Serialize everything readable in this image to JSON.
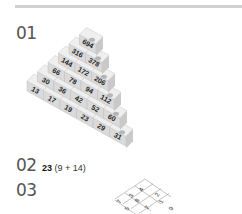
{
  "items": [
    {
      "number": "01"
    },
    {
      "number": "02",
      "answer_bold": "23",
      "answer_rest": " (9 + 14)"
    },
    {
      "number": "03"
    }
  ],
  "pyramid": {
    "rows": [
      [
        "694"
      ],
      [
        "316",
        "378"
      ],
      [
        "144",
        "172",
        "206"
      ],
      [
        "66",
        "78",
        "94",
        "112"
      ],
      [
        "30",
        "36",
        "42",
        "52",
        "60"
      ],
      [
        "13",
        "17",
        "19",
        "23",
        "29",
        "31"
      ]
    ]
  },
  "grid": {
    "cells": [
      "4",
      "3",
      "2",
      "7",
      "8",
      "1",
      "5",
      "7",
      "9"
    ]
  }
}
